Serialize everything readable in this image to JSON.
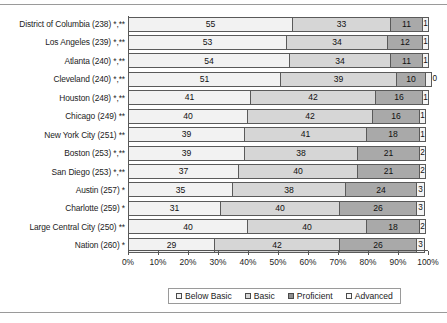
{
  "chart_data": {
    "type": "bar",
    "subtype": "stacked-horizontal-100pct",
    "title": "",
    "xlabel": "",
    "ylabel": "",
    "xlim": [
      0,
      100
    ],
    "grid": false,
    "legend_position": "bottom",
    "categories": [
      "District of Columbia (238) *,**",
      "Los Angeles (239) *,**",
      "Atlanta (240) *,**",
      "Cleveland (240) *,**",
      "Houston (248) *,**",
      "Chicago (249) **",
      "New York City (251) **",
      "Boston (253) *,**",
      "San Diego (253) *,**",
      "Austin (257) *",
      "Charlotte (259) *",
      "Large Central City (250) **",
      "Nation (260) *"
    ],
    "series": [
      {
        "name": "Below Basic",
        "color": "#f2f2f2",
        "values": [
          55,
          53,
          54,
          51,
          41,
          40,
          39,
          39,
          37,
          35,
          31,
          40,
          29
        ]
      },
      {
        "name": "Basic",
        "color": "#d6d6d6",
        "values": [
          33,
          34,
          34,
          39,
          42,
          42,
          41,
          38,
          40,
          38,
          40,
          40,
          42
        ]
      },
      {
        "name": "Proficient",
        "color": "#a9a9a9",
        "values": [
          11,
          12,
          11,
          10,
          16,
          16,
          18,
          21,
          21,
          24,
          26,
          18,
          26
        ]
      },
      {
        "name": "Advanced",
        "color": "#f4f4f4",
        "values": [
          1,
          1,
          1,
          0,
          1,
          1,
          1,
          2,
          2,
          3,
          3,
          2,
          3
        ]
      }
    ],
    "tick_labels": [
      "0%",
      "10%",
      "20%",
      "30%",
      "40%",
      "50%",
      "60%",
      "70%",
      "80%",
      "90%",
      "100%"
    ],
    "tick_values": [
      0,
      10,
      20,
      30,
      40,
      50,
      60,
      70,
      80,
      90,
      100
    ]
  },
  "legend": {
    "items": [
      {
        "label": "Below Basic",
        "swatch": "sw0"
      },
      {
        "label": "Basic",
        "swatch": "sw1"
      },
      {
        "label": "Proficient",
        "swatch": "sw2"
      },
      {
        "label": "Advanced",
        "swatch": "sw3"
      }
    ]
  }
}
